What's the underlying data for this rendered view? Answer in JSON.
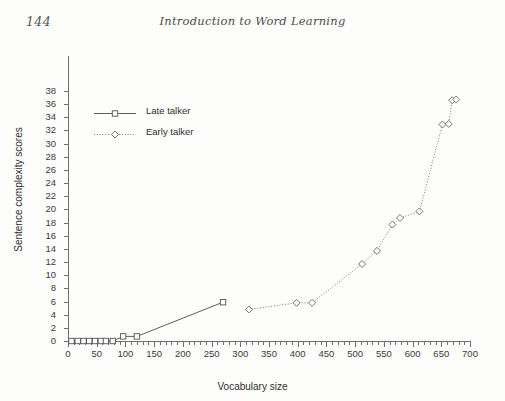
{
  "page": {
    "folio": "144",
    "running_title": "Introduction to Word Learning"
  },
  "legend": {
    "position": "upper-left-inside",
    "entries": [
      {
        "label": "Late talker",
        "marker": "open-square",
        "line": "solid"
      },
      {
        "label": "Early talker",
        "marker": "open-diamond",
        "line": "dotted"
      }
    ]
  },
  "chart_data": {
    "type": "line",
    "title": "",
    "xlabel": "Vocabulary size",
    "ylabel": "Sentence complexity scores",
    "xlim": [
      0,
      700
    ],
    "ylim": [
      0,
      38
    ],
    "xticks": [
      0,
      50,
      100,
      150,
      200,
      250,
      300,
      350,
      400,
      450,
      500,
      550,
      600,
      650,
      700
    ],
    "xtick_labels": [
      "0",
      "50",
      "100",
      "150",
      "200",
      "250",
      "300",
      "350",
      "400",
      "450",
      "500",
      "550",
      "600",
      "650",
      "700"
    ],
    "x_minor_tick_step": 10,
    "yticks": [
      0,
      2,
      4,
      6,
      8,
      10,
      12,
      14,
      16,
      18,
      20,
      22,
      24,
      26,
      28,
      30,
      32,
      34,
      36,
      38
    ],
    "ytick_labels": [
      "0",
      "2",
      "4",
      "6",
      "8",
      "10",
      "12",
      "14",
      "16",
      "18",
      "20",
      "22",
      "24",
      "26",
      "28",
      "30",
      "32",
      "34",
      "36",
      "38"
    ],
    "grid": false,
    "series": [
      {
        "name": "Late talker",
        "marker": "open-square",
        "line": "solid",
        "color": "#555555",
        "points": [
          {
            "x": 6,
            "y": 0
          },
          {
            "x": 17,
            "y": 0
          },
          {
            "x": 27,
            "y": 0
          },
          {
            "x": 37,
            "y": 0
          },
          {
            "x": 47,
            "y": 0
          },
          {
            "x": 57,
            "y": 0
          },
          {
            "x": 66,
            "y": 0
          },
          {
            "x": 78,
            "y": 0
          },
          {
            "x": 96,
            "y": 0.7
          },
          {
            "x": 120,
            "y": 0.7
          },
          {
            "x": 270,
            "y": 5.9
          }
        ]
      },
      {
        "name": "Early talker",
        "marker": "open-diamond",
        "line": "dotted",
        "color": "#666666",
        "points": [
          {
            "x": 315,
            "y": 4.8
          },
          {
            "x": 398,
            "y": 5.8
          },
          {
            "x": 425,
            "y": 5.8
          },
          {
            "x": 512,
            "y": 11.7
          },
          {
            "x": 538,
            "y": 13.7
          },
          {
            "x": 565,
            "y": 17.7
          },
          {
            "x": 578,
            "y": 18.7
          },
          {
            "x": 612,
            "y": 19.7
          },
          {
            "x": 652,
            "y": 32.9
          },
          {
            "x": 663,
            "y": 33.0
          },
          {
            "x": 669,
            "y": 36.6
          },
          {
            "x": 676,
            "y": 36.7
          }
        ]
      }
    ]
  }
}
